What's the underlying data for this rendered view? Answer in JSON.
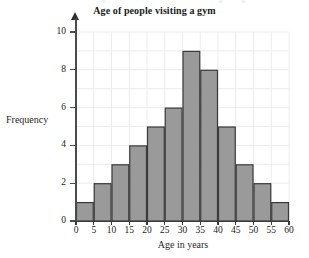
{
  "chart_data": {
    "type": "bar",
    "title": "Age of people visiting a gym",
    "xlabel": "Age in years",
    "ylabel": "Frequency",
    "categories": [
      "0-5",
      "5-10",
      "10-15",
      "15-20",
      "20-25",
      "25-30",
      "30-35",
      "35-40",
      "40-45",
      "45-50",
      "50-55",
      "55-60"
    ],
    "bin_edges": [
      0,
      5,
      10,
      15,
      20,
      25,
      30,
      35,
      40,
      45,
      50,
      55,
      60
    ],
    "values": [
      1,
      2,
      3,
      4,
      5,
      6,
      9,
      8,
      5,
      3,
      2,
      1
    ],
    "xlim": [
      0,
      60
    ],
    "ylim": [
      0,
      10
    ],
    "x_ticks": [
      0,
      5,
      10,
      15,
      20,
      25,
      30,
      35,
      40,
      45,
      50,
      55,
      60
    ],
    "x_tick_labels": [
      "0",
      "5",
      "10",
      "15",
      "20",
      "25",
      "30",
      "35",
      "40",
      "45",
      "50",
      "55",
      "60"
    ],
    "y_ticks": [
      0,
      2,
      4,
      6,
      8,
      10
    ],
    "y_tick_labels": [
      "0",
      "2",
      "4",
      "6",
      "8",
      "10"
    ],
    "y_minor_ticks": [
      1,
      3,
      5,
      7,
      9
    ],
    "grid": true,
    "legend": null,
    "bar_color": "#9a9a9a",
    "bar_edge_color": "#3a3a3a",
    "grid_color": "#ececec",
    "axis_color": "#3a3a3a",
    "background_color": "#ffffff",
    "y_axis_has_arrow": true
  }
}
